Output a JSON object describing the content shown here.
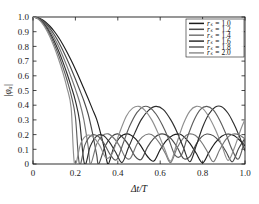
{
  "chart_data": {
    "type": "line",
    "title": "",
    "xlabel": "Δt/T",
    "ylabel": "|φₐ|",
    "xlim": [
      0,
      1.0
    ],
    "ylim": [
      0,
      1.0
    ],
    "grid": false,
    "legend_position": "top-right",
    "legend_title": "",
    "xticks": [
      "0",
      "0.2",
      "0.4",
      "0.6",
      "0.8",
      "1.0"
    ],
    "xtick_values": [
      0,
      0.2,
      0.4,
      0.6,
      0.8,
      1.0
    ],
    "yticks": [
      "0",
      "0.1",
      "0.2",
      "0.3",
      "0.4",
      "0.5",
      "0.6",
      "0.7",
      "0.8",
      "0.9",
      "1.0"
    ],
    "ytick_values": [
      0,
      0.1,
      0.2,
      0.3,
      0.4,
      0.5,
      0.6,
      0.7,
      0.8,
      0.9,
      1.0
    ],
    "series": [
      {
        "name": "r_s = 1.0",
        "label_symbol": "rₛ =",
        "label_value": "1.0",
        "color": "#1c1c1c",
        "param": 1.0,
        "first_zero": 0.355,
        "lobe_peak": 0.205,
        "x": [
          0.0,
          0.02,
          0.04,
          0.06,
          0.08,
          0.1,
          0.12,
          0.14,
          0.16,
          0.18,
          0.2,
          0.22,
          0.24,
          0.26,
          0.28,
          0.3,
          0.32,
          0.34,
          0.355,
          0.38,
          0.41,
          0.445,
          0.48,
          0.51,
          0.54,
          0.57,
          0.6,
          0.63,
          0.66,
          0.69,
          0.71,
          0.74,
          0.77,
          0.8,
          0.83,
          0.86,
          0.89,
          0.92,
          0.95,
          0.98,
          1.0
        ],
        "y": [
          1.0,
          0.996,
          0.984,
          0.964,
          0.937,
          0.903,
          0.862,
          0.815,
          0.762,
          0.705,
          0.644,
          0.58,
          0.513,
          0.445,
          0.375,
          0.305,
          0.203,
          0.085,
          0.0,
          0.108,
          0.181,
          0.205,
          0.176,
          0.12,
          0.051,
          0.02,
          0.098,
          0.16,
          0.196,
          0.203,
          0.188,
          0.14,
          0.073,
          0.008,
          0.079,
          0.145,
          0.189,
          0.204,
          0.192,
          0.155,
          0.124
        ]
      },
      {
        "name": "r_s = 1.2",
        "label_symbol": "rₛ =",
        "label_value": "1.2",
        "color": "#4a4a4a",
        "param": 1.2,
        "first_zero": 0.31,
        "lobe_peak": 0.205,
        "x": [
          0.0,
          0.02,
          0.04,
          0.06,
          0.08,
          0.1,
          0.12,
          0.14,
          0.16,
          0.18,
          0.2,
          0.22,
          0.24,
          0.26,
          0.28,
          0.3,
          0.31,
          0.34,
          0.37,
          0.4,
          0.43,
          0.455,
          0.48,
          0.51,
          0.54,
          0.57,
          0.6,
          0.625,
          0.65,
          0.68,
          0.71,
          0.74,
          0.77,
          0.795,
          0.82,
          0.85,
          0.88,
          0.91,
          0.94,
          0.97,
          1.0
        ],
        "y": [
          1.0,
          0.995,
          0.98,
          0.956,
          0.923,
          0.881,
          0.832,
          0.776,
          0.714,
          0.648,
          0.578,
          0.505,
          0.43,
          0.34,
          0.215,
          0.065,
          0.0,
          0.12,
          0.185,
          0.205,
          0.17,
          0.12,
          0.055,
          0.03,
          0.115,
          0.175,
          0.203,
          0.2,
          0.175,
          0.115,
          0.038,
          0.05,
          0.135,
          0.185,
          0.204,
          0.193,
          0.152,
          0.085,
          0.015,
          0.105,
          0.175
        ]
      },
      {
        "name": "r_s = 1.4",
        "label_symbol": "rₛ =",
        "label_value": "1.4",
        "color": "#757575",
        "param": 1.4,
        "first_zero": 0.272,
        "lobe_peak": 0.205,
        "x": [
          0.0,
          0.02,
          0.04,
          0.06,
          0.08,
          0.1,
          0.12,
          0.14,
          0.16,
          0.18,
          0.2,
          0.22,
          0.24,
          0.26,
          0.272,
          0.3,
          0.325,
          0.355,
          0.385,
          0.41,
          0.435,
          0.46,
          0.49,
          0.515,
          0.545,
          0.57,
          0.6,
          0.625,
          0.65,
          0.68,
          0.71,
          0.735,
          0.765,
          0.795,
          0.82,
          0.85,
          0.88,
          0.91,
          0.94,
          0.97,
          1.0
        ],
        "y": [
          1.0,
          0.994,
          0.976,
          0.947,
          0.908,
          0.859,
          0.802,
          0.737,
          0.666,
          0.59,
          0.509,
          0.42,
          0.3,
          0.12,
          0.0,
          0.135,
          0.19,
          0.205,
          0.17,
          0.118,
          0.048,
          0.04,
          0.135,
          0.183,
          0.204,
          0.19,
          0.135,
          0.07,
          0.01,
          0.11,
          0.178,
          0.204,
          0.195,
          0.148,
          0.09,
          0.015,
          0.095,
          0.168,
          0.202,
          0.2,
          0.17
        ]
      },
      {
        "name": "r_s = 1.6",
        "label_symbol": "rₛ =",
        "label_value": "1.6",
        "color": "#2e2e2e",
        "param": 1.6,
        "first_zero": 0.243,
        "lobe_peak": 0.392,
        "x": [
          0.0,
          0.02,
          0.04,
          0.06,
          0.08,
          0.1,
          0.12,
          0.14,
          0.16,
          0.18,
          0.2,
          0.22,
          0.243,
          0.27,
          0.3,
          0.33,
          0.36,
          0.39,
          0.42,
          0.45,
          0.48,
          0.51,
          0.545,
          0.58,
          0.615,
          0.65,
          0.68,
          0.71,
          0.74,
          0.77,
          0.8,
          0.83,
          0.86,
          0.89,
          0.92,
          0.945,
          0.97,
          1.0
        ],
        "y": [
          1.0,
          0.993,
          0.972,
          0.939,
          0.893,
          0.837,
          0.772,
          0.698,
          0.617,
          0.528,
          0.43,
          0.29,
          0.0,
          0.12,
          0.19,
          0.195,
          0.15,
          0.08,
          0.01,
          0.11,
          0.21,
          0.3,
          0.365,
          0.392,
          0.37,
          0.3,
          0.215,
          0.11,
          0.015,
          0.125,
          0.25,
          0.34,
          0.388,
          0.39,
          0.345,
          0.28,
          0.2,
          0.09
        ]
      },
      {
        "name": "r_s = 1.8",
        "label_symbol": "rₛ =",
        "label_value": "1.8",
        "color": "#5c5c5c",
        "param": 1.8,
        "first_zero": 0.219,
        "lobe_peak": 0.392,
        "x": [
          0.0,
          0.02,
          0.04,
          0.06,
          0.08,
          0.1,
          0.12,
          0.14,
          0.16,
          0.18,
          0.2,
          0.219,
          0.245,
          0.275,
          0.305,
          0.335,
          0.365,
          0.395,
          0.425,
          0.455,
          0.49,
          0.52,
          0.55,
          0.58,
          0.61,
          0.64,
          0.67,
          0.7,
          0.73,
          0.76,
          0.79,
          0.82,
          0.85,
          0.88,
          0.91,
          0.94,
          0.97,
          1.0
        ],
        "y": [
          1.0,
          0.992,
          0.968,
          0.93,
          0.879,
          0.817,
          0.745,
          0.664,
          0.573,
          0.468,
          0.32,
          0.0,
          0.13,
          0.195,
          0.19,
          0.14,
          0.062,
          0.03,
          0.14,
          0.255,
          0.35,
          0.39,
          0.385,
          0.34,
          0.265,
          0.17,
          0.06,
          0.06,
          0.19,
          0.3,
          0.372,
          0.392,
          0.368,
          0.3,
          0.205,
          0.095,
          0.035,
          0.17
        ]
      },
      {
        "name": "r_s = 2.0",
        "label_symbol": "rₛ =",
        "label_value": "2.0",
        "color": "#8f8f8f",
        "param": 2.0,
        "first_zero": 0.196,
        "lobe_peak": 0.392,
        "x": [
          0.0,
          0.02,
          0.04,
          0.06,
          0.08,
          0.1,
          0.12,
          0.14,
          0.16,
          0.18,
          0.196,
          0.225,
          0.255,
          0.285,
          0.315,
          0.345,
          0.375,
          0.405,
          0.44,
          0.47,
          0.5,
          0.53,
          0.56,
          0.59,
          0.62,
          0.65,
          0.68,
          0.71,
          0.74,
          0.77,
          0.8,
          0.83,
          0.86,
          0.89,
          0.92,
          0.95,
          0.98,
          1.0
        ],
        "y": [
          1.0,
          0.991,
          0.964,
          0.921,
          0.864,
          0.795,
          0.716,
          0.626,
          0.52,
          0.38,
          0.0,
          0.14,
          0.195,
          0.182,
          0.125,
          0.04,
          0.075,
          0.2,
          0.325,
          0.38,
          0.392,
          0.362,
          0.3,
          0.21,
          0.105,
          0.02,
          0.15,
          0.275,
          0.36,
          0.392,
          0.378,
          0.32,
          0.235,
          0.13,
          0.025,
          0.11,
          0.235,
          0.305
        ]
      }
    ]
  },
  "axes": {
    "x_title": "Δt/T",
    "y_title": "|φₐ|"
  }
}
